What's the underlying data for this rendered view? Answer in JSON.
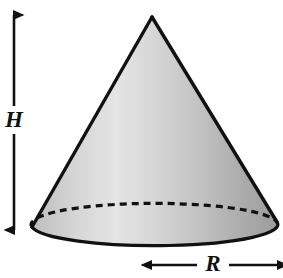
{
  "figure": {
    "background_color": "#ffffff",
    "width": 283,
    "height": 278
  },
  "shape": {
    "name": "cone",
    "fill_light_color": "#e6e6e6",
    "fill_mid_color": "#c8c8c8",
    "fill_dark_color": "#9e9e9e",
    "outline_color": "#111111",
    "outline_width": 3,
    "apex": {
      "x": 152,
      "y": 17
    },
    "base_center": {
      "x": 154.5,
      "y": 224
    },
    "base_radius_x": 122.5,
    "base_radius_y": 21,
    "left_base_point": {
      "x": 32,
      "y": 227
    },
    "right_base_point": {
      "x": 277,
      "y": 222
    },
    "hidden_back_edge": {
      "name": "dashed-back-ellipse-arc",
      "style": "dashed",
      "dash_pattern": "7 5",
      "color": "#111111",
      "width": 3
    }
  },
  "dimensions": {
    "height": {
      "label": "H",
      "axis": "vertical",
      "arrow_style": "double-headed",
      "line_x": 14,
      "top_y": 15,
      "bottom_y": 230,
      "label_center": {
        "x": 14,
        "y": 120
      },
      "color": "#111111"
    },
    "radius": {
      "label": "R",
      "axis": "horizontal",
      "arrow_style": "double-headed",
      "line_y": 265,
      "left_x": 151,
      "right_x": 278,
      "label_center": {
        "x": 213,
        "y": 264
      },
      "color": "#111111"
    }
  }
}
